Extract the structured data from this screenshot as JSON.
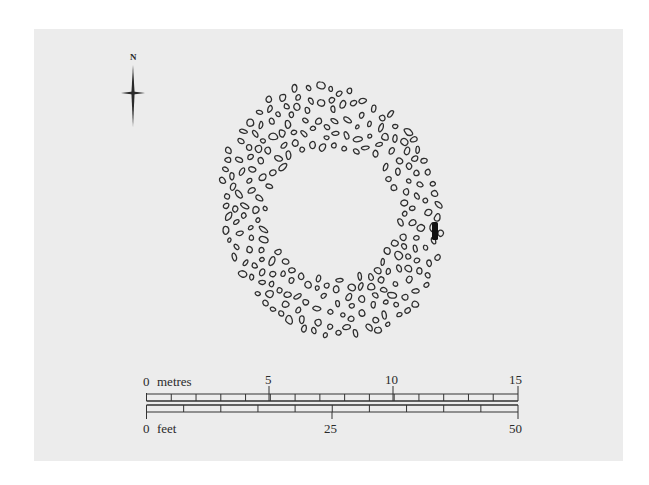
{
  "figure": {
    "type": "archaeological site plan",
    "north_arrow": {
      "label": "N"
    },
    "feature": {
      "shape": "oval stone ring with open centre",
      "fill_style": "outlined stones",
      "marker": "single solid black stone on east side"
    },
    "scale_bars": [
      {
        "unit": "metres",
        "labels": [
          "0",
          "5",
          "10",
          "15"
        ],
        "min": 0,
        "max": 15,
        "minor_divisions": 15
      },
      {
        "unit": "feet",
        "labels": [
          "0",
          "25",
          "50"
        ],
        "min": 0,
        "max": 50,
        "minor_divisions": 10
      }
    ],
    "colors": {
      "panel": "#ececec",
      "ink": "#2a2a2a",
      "background": "#ffffff"
    }
  },
  "labels": {
    "north": "N",
    "metres_zero": "0",
    "metres_unit": "metres",
    "metres_5": "5",
    "metres_10": "10",
    "metres_15": "15",
    "feet_zero": "0",
    "feet_unit": "feet",
    "feet_25": "25",
    "feet_50": "50"
  }
}
